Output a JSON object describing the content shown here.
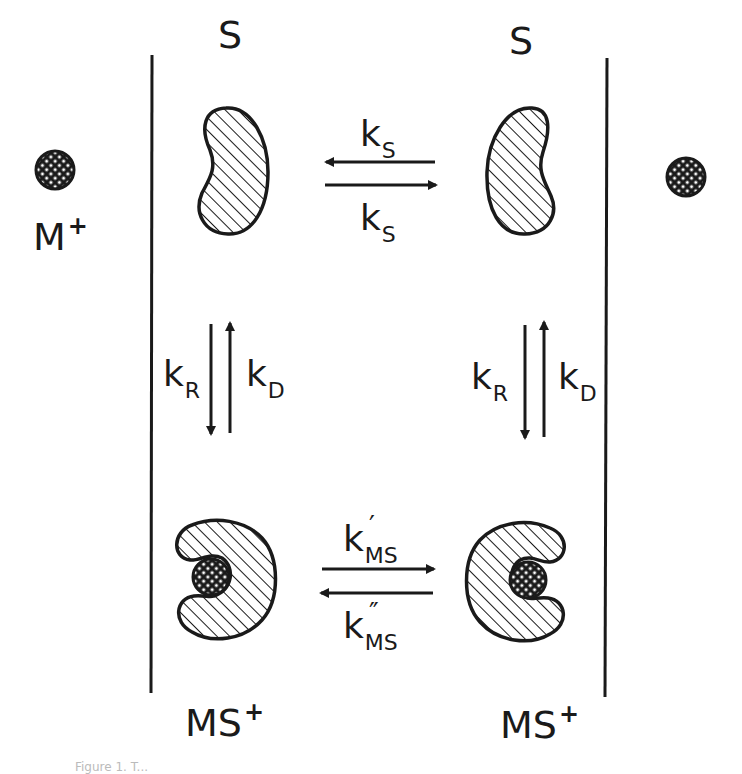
{
  "figure": {
    "colors": {
      "ink": "#1a1a1a",
      "background": "#ffffff"
    },
    "species": {
      "carrier_free": {
        "label": "S"
      },
      "ion": {
        "label": "M",
        "charge": "+"
      },
      "complex": {
        "label": "MS",
        "charge": "+"
      }
    },
    "labels": {
      "s_left": "S",
      "s_right": "S",
      "ion_left": {
        "base": "M",
        "sup": "+"
      },
      "complex_left": {
        "base": "MS",
        "sup": "+"
      },
      "complex_right": {
        "base": "MS",
        "sup": "+"
      }
    },
    "rate_constants": {
      "ks_top": {
        "base": "k",
        "sub": "S"
      },
      "ks_bottom": {
        "base": "k",
        "sub": "S"
      },
      "kr_left": {
        "base": "k",
        "sub": "R"
      },
      "kd_left": {
        "base": "k",
        "sub": "D"
      },
      "kr_right": {
        "base": "k",
        "sub": "R"
      },
      "kd_right": {
        "base": "k",
        "sub": "D"
      },
      "kms_forward": {
        "base": "k",
        "prime": "′",
        "sub": "MS"
      },
      "kms_reverse": {
        "base": "k",
        "prime": "″",
        "sub": "MS"
      }
    },
    "caption_fragment": "Figure 1. T..."
  }
}
